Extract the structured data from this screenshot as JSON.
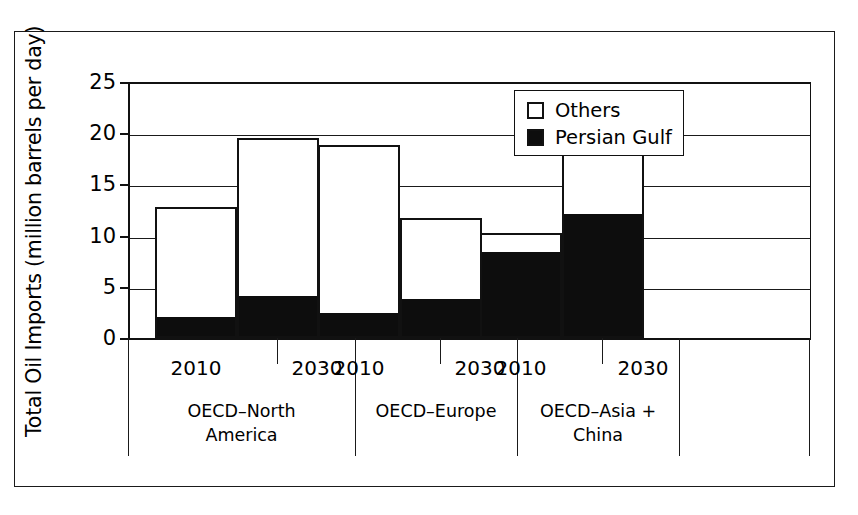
{
  "chart_data": {
    "type": "bar",
    "subtype": "stacked",
    "title": "",
    "xlabel": "",
    "ylabel": "Total Oil Imports (million barrels per day)",
    "ylim": [
      0,
      25
    ],
    "yticks": [
      0,
      5,
      10,
      15,
      20,
      25
    ],
    "ytick_labels": [
      "0",
      "5",
      "10",
      "15",
      "20",
      "25"
    ],
    "grid": true,
    "grid_axis": "y",
    "legend_position": "upper-center",
    "categories": [
      "OECD–North America 2010",
      "OECD–North America 2030",
      "OECD–Europe 2010",
      "OECD–Europe 2030",
      "OECD–Asia + China 2010",
      "OECD–Asia + China 2030"
    ],
    "series": [
      {
        "name": "Persian Gulf",
        "color": "#0d0d0d",
        "values": [
          1.9,
          3.9,
          2.2,
          3.6,
          8.2,
          11.9
        ]
      },
      {
        "name": "Others",
        "color": "#ffffff",
        "values": [
          10.9,
          15.6,
          16.6,
          8.1,
          2.1,
          8.3
        ]
      }
    ],
    "totals": [
      12.8,
      19.5,
      18.8,
      11.7,
      10.3,
      20.2
    ],
    "groups": [
      {
        "label": "OECD–North America",
        "label_line1": "OECD–North",
        "label_line2": "America",
        "years": [
          "2010",
          "2030"
        ]
      },
      {
        "label": "OECD–Europe",
        "label_line1": "OECD–Europe",
        "label_line2": "",
        "years": [
          "2010",
          "2030"
        ]
      },
      {
        "label": "OECD–Asia + China",
        "label_line1": "OECD–Asia + China",
        "label_line2": "",
        "years": [
          "2010",
          "2030"
        ]
      }
    ]
  },
  "legend": {
    "entries": [
      {
        "label": "Others",
        "swatch": "empty"
      },
      {
        "label": "Persian Gulf",
        "swatch": "filled"
      }
    ]
  }
}
